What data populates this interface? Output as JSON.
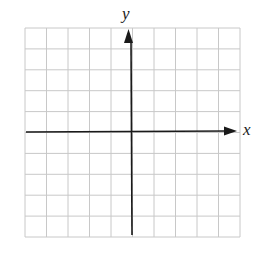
{
  "diagram": {
    "type": "coordinate-plane",
    "grid": {
      "columns": 10,
      "rows": 10,
      "line_color": "#c8c8c8"
    },
    "axes": {
      "x_label": "x",
      "y_label": "y",
      "color": "#1a1a1a",
      "x_arrow": "positive-end",
      "y_arrow": "positive-end"
    }
  }
}
